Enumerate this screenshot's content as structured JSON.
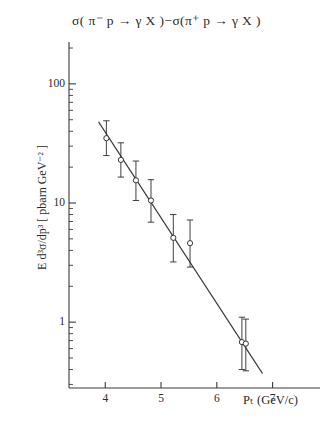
{
  "chart_data": {
    "type": "scatter",
    "title": "σ( π⁻ p → γ X )−σ(π⁺ p → γ X )",
    "title_plain": "sigma(pi- p -> gamma X) - sigma(pi+ p -> gamma X)",
    "xlabel": "Pₜ (GeV/c)",
    "ylabel": "E d³σ/dp³ [ pbarn GeV⁻² ]",
    "xlabel_main": "P",
    "xlabel_sub": "T",
    "xlabel_unit": "(GeV/c)",
    "xscale": "linear",
    "yscale": "log",
    "xlim": [
      3.35,
      7.85
    ],
    "ylim": [
      0.28,
      200
    ],
    "xticks": [
      4,
      5,
      6,
      7
    ],
    "xtick_labels": [
      "4",
      "5",
      "6",
      "7"
    ],
    "yticks": [
      1,
      10,
      100
    ],
    "ytick_labels": [
      "1",
      "10",
      "100"
    ],
    "grid": false,
    "legend": "none",
    "marker": "open-circle",
    "errorbars": "vertical",
    "x": [
      4.02,
      4.28,
      4.55,
      4.82,
      5.22,
      5.52,
      6.45,
      6.52
    ],
    "y": [
      35.0,
      23.0,
      15.5,
      10.5,
      5.1,
      4.6,
      0.68,
      0.66
    ],
    "yerr_up": [
      14.0,
      9.0,
      7.0,
      5.2,
      2.9,
      2.6,
      0.42,
      0.4
    ],
    "yerr_down": [
      10.0,
      6.5,
      5.0,
      3.6,
      1.9,
      1.7,
      0.28,
      0.27
    ],
    "points": [
      {
        "x": 4.02,
        "y": 35.0,
        "yerr_up": 14.0,
        "yerr_down": 10.0
      },
      {
        "x": 4.28,
        "y": 23.0,
        "yerr_up": 9.0,
        "yerr_down": 6.5
      },
      {
        "x": 4.55,
        "y": 15.5,
        "yerr_up": 7.0,
        "yerr_down": 5.0
      },
      {
        "x": 4.82,
        "y": 10.5,
        "yerr_up": 5.2,
        "yerr_down": 3.6
      },
      {
        "x": 5.22,
        "y": 5.1,
        "yerr_up": 2.9,
        "yerr_down": 1.9
      },
      {
        "x": 5.52,
        "y": 4.6,
        "yerr_up": 2.6,
        "yerr_down": 1.7
      },
      {
        "x": 6.45,
        "y": 0.68,
        "yerr_up": 0.42,
        "yerr_down": 0.28
      },
      {
        "x": 6.52,
        "y": 0.66,
        "yerr_up": 0.4,
        "yerr_down": 0.27
      }
    ],
    "fit_line": {
      "label": "power-law fit",
      "x_start": 3.88,
      "y_start": 48.0,
      "x_end": 6.82,
      "y_end": 0.37
    },
    "colors": {
      "axis": "#3a3a3a",
      "data": "#2b2b2b",
      "fit": "#3a3a3a",
      "background": "#ffffff"
    }
  }
}
